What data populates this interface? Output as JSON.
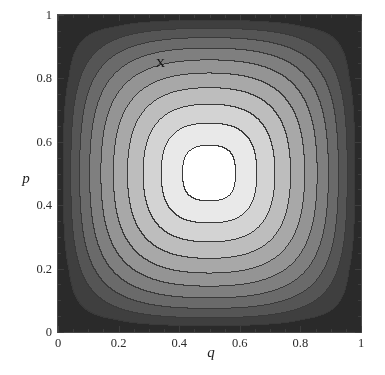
{
  "figure": {
    "background_color": "#ffffff",
    "frame_color": "#4a4a4a",
    "annotation_color": "#111111"
  },
  "chart_data": {
    "type": "heatmap",
    "title": "",
    "subtitle": "",
    "xlabel": "q",
    "ylabel": "p",
    "xlim": [
      0,
      1
    ],
    "ylim": [
      0,
      1
    ],
    "grid": false,
    "legend": "none",
    "style": "filled grayscale contour plot",
    "colormap": "grayscale",
    "colormap_low": "#ffffff",
    "colormap_high": "#2a2a2a",
    "x_ticks": [
      0,
      0.2,
      0.4,
      0.6,
      0.8,
      1
    ],
    "x_tick_labels": [
      "0",
      "0.2",
      "0.4",
      "0.6",
      "0.8",
      "1"
    ],
    "x_minor_ticks": [
      0.05,
      0.1,
      0.15,
      0.25,
      0.3,
      0.35,
      0.45,
      0.5,
      0.55,
      0.65,
      0.7,
      0.75,
      0.85,
      0.9,
      0.95
    ],
    "y_ticks": [
      0,
      0.2,
      0.4,
      0.6,
      0.8,
      1
    ],
    "y_tick_labels": [
      "0",
      "0.2",
      "0.4",
      "0.6",
      "0.8",
      "1"
    ],
    "y_minor_ticks": [
      0.05,
      0.1,
      0.15,
      0.25,
      0.3,
      0.35,
      0.45,
      0.5,
      0.55,
      0.65,
      0.7,
      0.75,
      0.85,
      0.9,
      0.95
    ],
    "function_description": "symmetric entropy-like surface with maximum at (0.5, 0.5), minimum at the four corners",
    "center": [
      0.5,
      0.5
    ],
    "contour_count": 10,
    "contour_line_color": "#3a3a3a",
    "contour_levels": [
      0.0,
      0.1,
      0.2,
      0.3,
      0.4,
      0.5,
      0.6,
      0.7,
      0.8,
      0.9,
      1.0
    ],
    "band_fill_colors": [
      "#ffffff",
      "#e9e9e9",
      "#d3d3d3",
      "#bdbdbd",
      "#a8a8a8",
      "#949494",
      "#7f7f7f",
      "#6a6a6a",
      "#555555",
      "#3f3f3f",
      "#2a2a2a"
    ],
    "annotations": [
      {
        "text": "X",
        "x": 0.335,
        "y": 0.855
      }
    ]
  }
}
